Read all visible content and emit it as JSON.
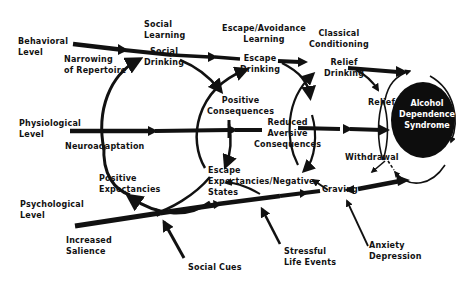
{
  "diagram": {
    "levels": {
      "behavioral": "Behavioral\nLevel",
      "physiological": "Physiological\nLevel",
      "psychological": "Psychological\nLevel"
    },
    "learning": {
      "social": "Social\nLearning",
      "escape_avoidance": "Escape/Avoidance\nLearning",
      "classical": "Classical\nConditioning"
    },
    "nodes": {
      "narrowing": "Narrowing\nof Repertoire",
      "social_drinking": "Social\nDrinking",
      "escape_drinking": "Escape\nDrinking",
      "relief_drinking": "Relief\nDrinking",
      "positive_consequences": "Positive\nConsequences",
      "neuroadaptation": "Neuroadaptation",
      "reduced_aversive": "Reduced\nAversive\nConsequences",
      "relief": "Relief",
      "withdrawal": "Withdrawal",
      "positive_expectancies": "Positive\nExpectancies",
      "escape_expectancies": "Escape\nExpectancies/Negative\nStates",
      "craving": "Craving",
      "increased_salience": "Increased\nSalience",
      "social_cues": "Social Cues",
      "stressful_life_events": "Stressful\nLife Events",
      "anxiety_depression": "Anxiety\nDepression",
      "syndrome": "Alcohol\nDependence\nSyndrome"
    },
    "colors": {
      "ink": "#111111",
      "background": "#ffffff",
      "syndrome_fill": "#0d0d0d",
      "syndrome_text": "#ffffff"
    }
  }
}
